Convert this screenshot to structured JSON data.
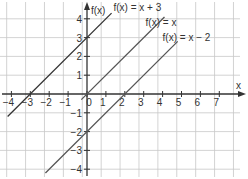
{
  "chart_data": {
    "type": "line",
    "title": "",
    "xlabel": "x",
    "ylabel": "f(x)",
    "xlim": [
      -4.2,
      7.9
    ],
    "ylim": [
      -4.2,
      4.7
    ],
    "grid": true,
    "x_ticks": [
      -4,
      -3,
      -2,
      -1,
      0,
      1,
      2,
      3,
      4,
      5,
      6,
      7
    ],
    "y_ticks": [
      -4,
      -3,
      -2,
      -1,
      1,
      2,
      3,
      4
    ],
    "series": [
      {
        "name": "f(x) = x + 3",
        "slope": 1,
        "intercept": 3,
        "x": [
          -4.2,
          1.3
        ],
        "color": "#333333"
      },
      {
        "name": "f(x) = x",
        "slope": 1,
        "intercept": 0,
        "x": [
          -0.3,
          4.1
        ],
        "color": "#555555"
      },
      {
        "name": "f(x) = x − 2",
        "slope": 1,
        "intercept": -2,
        "x": [
          -2.2,
          4.8
        ],
        "color": "#555555"
      }
    ],
    "annotations": [
      {
        "text": "f(x) = x + 3",
        "x": 1.4,
        "y": 4.4
      },
      {
        "text": "f(x) = x",
        "x": 3.1,
        "y": 3.6
      },
      {
        "text": "f(x) = x − 2",
        "x": 4.0,
        "y": 2.8
      }
    ]
  }
}
